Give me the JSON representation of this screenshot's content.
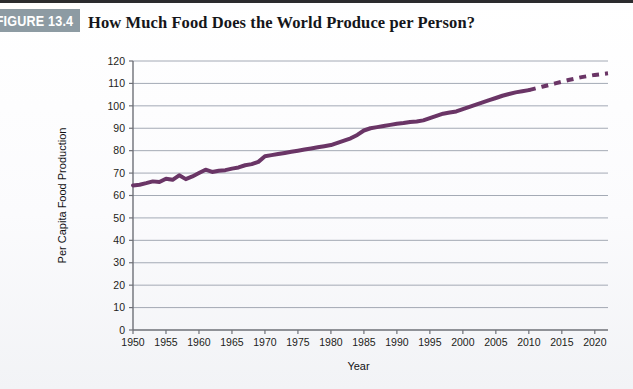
{
  "figure": {
    "badge_label": "FIGURE 13.4",
    "badge_color": "#8d9ba3",
    "title": "How Much Food Does the World Produce per Person?"
  },
  "chart_data": {
    "type": "line",
    "title": "How Much Food Does the World Produce per Person?",
    "xlabel": "Year",
    "ylabel": "Per Capita Food Production",
    "xlim": [
      1950,
      2022
    ],
    "ylim": [
      0,
      120
    ],
    "ytick_step": 10,
    "xtick_step": 5,
    "grid": "horizontal",
    "legend": "none",
    "line_color": "#6a3566",
    "line_width_px": 4,
    "yticks": [
      0,
      10,
      20,
      30,
      40,
      50,
      60,
      70,
      80,
      90,
      100,
      110,
      120
    ],
    "xticks": [
      1950,
      1955,
      1960,
      1965,
      1970,
      1975,
      1980,
      1985,
      1990,
      1995,
      2000,
      2005,
      2010,
      2015,
      2020
    ],
    "ytick_labels": [
      "0",
      "10",
      "20",
      "30",
      "40",
      "50",
      "60",
      "70",
      "80",
      "90",
      "100",
      "110",
      "120"
    ],
    "xtick_labels": [
      "1950",
      "1955",
      "1960",
      "1965",
      "1970",
      "1975",
      "1980",
      "1985",
      "1990",
      "1995",
      "2000",
      "2005",
      "2010",
      "2015",
      "2020"
    ],
    "series": [
      {
        "name": "Per capita food production (observed)",
        "style": "solid",
        "x": [
          1950,
          1951,
          1952,
          1953,
          1954,
          1955,
          1956,
          1957,
          1958,
          1959,
          1960,
          1961,
          1962,
          1963,
          1964,
          1965,
          1966,
          1967,
          1968,
          1969,
          1970,
          1971,
          1972,
          1973,
          1974,
          1975,
          1976,
          1977,
          1978,
          1979,
          1980,
          1981,
          1982,
          1983,
          1984,
          1985,
          1986,
          1987,
          1988,
          1989,
          1990,
          1991,
          1992,
          1993,
          1994,
          1995,
          1996,
          1997,
          1998,
          1999,
          2000,
          2001,
          2002,
          2003,
          2004,
          2005,
          2006,
          2007,
          2008,
          2009,
          2010
        ],
        "values": [
          64.5,
          64.8,
          65.5,
          66.3,
          66.0,
          67.5,
          67.0,
          69.0,
          67.3,
          68.5,
          70.0,
          71.5,
          70.5,
          71.0,
          71.3,
          72.0,
          72.5,
          73.5,
          74.0,
          75.0,
          77.5,
          78.0,
          78.5,
          79.0,
          79.5,
          80.0,
          80.5,
          81.0,
          81.5,
          82.0,
          82.5,
          83.5,
          84.5,
          85.5,
          87.0,
          89.0,
          90.0,
          90.5,
          91.0,
          91.5,
          92.0,
          92.3,
          92.8,
          93.0,
          93.5,
          94.5,
          95.5,
          96.5,
          97.0,
          97.5,
          98.5,
          99.5,
          100.5,
          101.5,
          102.5,
          103.5,
          104.5,
          105.3,
          106.0,
          106.5,
          107.0
        ]
      },
      {
        "name": "Projection",
        "style": "dashed",
        "x": [
          2010,
          2012,
          2014,
          2016,
          2018,
          2020,
          2022
        ],
        "values": [
          107.0,
          108.5,
          110.0,
          111.5,
          112.8,
          113.8,
          114.5
        ]
      }
    ]
  }
}
